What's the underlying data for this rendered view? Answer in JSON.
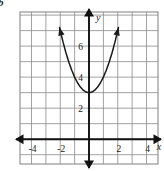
{
  "figure": {
    "label": "b",
    "caption": ""
  },
  "chart_data": {
    "type": "line",
    "title": "",
    "subtitle": "",
    "xlabel": "x",
    "ylabel": "y",
    "xlim": [
      -4.8,
      4.8
    ],
    "ylim": [
      -1.6,
      8.2
    ],
    "grid": true,
    "grid_spacing": 1,
    "legend": null,
    "legend_position": "none",
    "axis_arrows": true,
    "series": [
      {
        "name": "parabola",
        "equation": "y = x^2 + 3",
        "vertex": [
          0,
          3
        ],
        "opens": "up",
        "color": "#1a1a1a",
        "x": [
          -2.05,
          -1.8,
          -1.6,
          -1.4,
          -1.2,
          -1.0,
          -0.8,
          -0.6,
          -0.4,
          -0.2,
          0,
          0.2,
          0.4,
          0.6,
          0.8,
          1.0,
          1.2,
          1.4,
          1.6,
          1.8,
          2.05
        ],
        "y": [
          7.2,
          6.24,
          5.56,
          4.96,
          4.44,
          4.0,
          3.64,
          3.36,
          3.16,
          3.04,
          3.0,
          3.04,
          3.16,
          3.36,
          3.64,
          4.0,
          4.44,
          4.96,
          5.56,
          6.24,
          7.2
        ]
      }
    ],
    "x_ticks": [
      -4,
      -2,
      2,
      4
    ],
    "x_tick_labels": [
      "-4",
      "-2",
      "2",
      "4"
    ],
    "y_ticks": [
      2,
      4,
      6
    ],
    "y_tick_labels": [
      "2",
      "4",
      "6"
    ],
    "axis_label_x": "x",
    "axis_label_y": "y",
    "colors": {
      "curve": "#1a1a1a",
      "axis": "#111111",
      "grid": "#8a8a8a",
      "background": "#ffffff",
      "text": "#1a1a1a"
    }
  }
}
